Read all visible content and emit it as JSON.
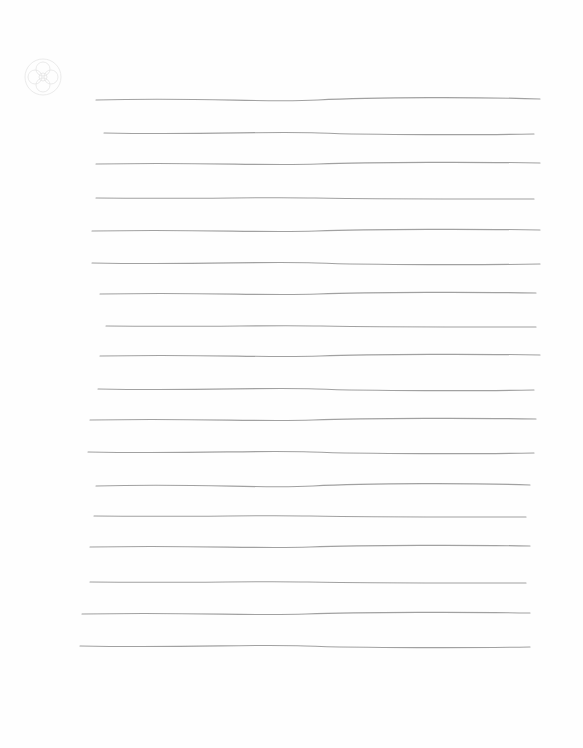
{
  "document": {
    "type": "hand-ruled lined paper",
    "text_content": "",
    "line_color": "#8a8a8a",
    "background": "#fefefe",
    "stamp_icon": "faint-decorative-emblem"
  },
  "lines": [
    {
      "x1": 96,
      "x2": 540,
      "y": 100,
      "wobble": 3
    },
    {
      "x1": 104,
      "x2": 534,
      "y": 133,
      "wobble": 2
    },
    {
      "x1": 96,
      "x2": 540,
      "y": 164,
      "wobble": 2
    },
    {
      "x1": 96,
      "x2": 534,
      "y": 198,
      "wobble": 1
    },
    {
      "x1": 92,
      "x2": 540,
      "y": 231,
      "wobble": 2
    },
    {
      "x1": 92,
      "x2": 540,
      "y": 263,
      "wobble": 2
    },
    {
      "x1": 100,
      "x2": 536,
      "y": 294,
      "wobble": 2
    },
    {
      "x1": 106,
      "x2": 536,
      "y": 326,
      "wobble": 1
    },
    {
      "x1": 100,
      "x2": 540,
      "y": 356,
      "wobble": 2
    },
    {
      "x1": 98,
      "x2": 534,
      "y": 389,
      "wobble": 2
    },
    {
      "x1": 90,
      "x2": 536,
      "y": 420,
      "wobble": 2
    },
    {
      "x1": 88,
      "x2": 534,
      "y": 452,
      "wobble": 2
    },
    {
      "x1": 96,
      "x2": 530,
      "y": 486,
      "wobble": 3
    },
    {
      "x1": 94,
      "x2": 526,
      "y": 516,
      "wobble": 1
    },
    {
      "x1": 90,
      "x2": 530,
      "y": 547,
      "wobble": 2
    },
    {
      "x1": 90,
      "x2": 526,
      "y": 582,
      "wobble": 1
    },
    {
      "x1": 82,
      "x2": 530,
      "y": 614,
      "wobble": 2
    },
    {
      "x1": 80,
      "x2": 530,
      "y": 646,
      "wobble": 2
    }
  ]
}
